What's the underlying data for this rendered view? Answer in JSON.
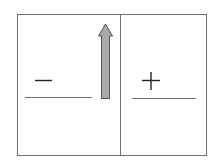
{
  "diagram": {
    "type": "charged-plates-field",
    "left_region": {
      "sign": "−",
      "charge": "negative"
    },
    "right_region": {
      "sign": "+",
      "charge": "positive"
    },
    "arrow": {
      "direction": "up",
      "fill": "#a9a9a9",
      "stroke": "#555555"
    },
    "colors": {
      "frame": "#6e6e6e",
      "background": "#ffffff"
    }
  }
}
